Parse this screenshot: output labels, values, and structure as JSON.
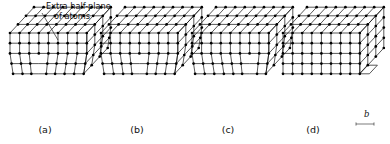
{
  "figure": {
    "background_color": "#ffffff",
    "line_color": "#111111",
    "back_line_color": "#555555",
    "atom_color": "#000000",
    "width": 390,
    "height": 144
  },
  "annotation": {
    "line1": "Extra half-plane",
    "line2": "of atoms",
    "text_x": 46,
    "text_y1": 9,
    "text_y2": 19,
    "leader": {
      "x1": 42,
      "y1": 13,
      "x2": 58,
      "y2": 40
    }
  },
  "panels": [
    {
      "id": "a",
      "label": "(a)",
      "label_x": 45,
      "label_y": 133,
      "origin_x": 10,
      "origin_y": 33,
      "dislocation_column": 3,
      "has_step": false,
      "state": "extra half-plane near left"
    },
    {
      "id": "b",
      "label": "(b)",
      "label_x": 137,
      "label_y": 133,
      "origin_x": 101,
      "origin_y": 33,
      "dislocation_column": 4,
      "has_step": false,
      "state": "dislocation advanced toward center"
    },
    {
      "id": "c",
      "label": "(c)",
      "label_x": 228,
      "label_y": 133,
      "origin_x": 192,
      "origin_y": 33,
      "dislocation_column": 6,
      "has_step": false,
      "state": "dislocation near right face"
    },
    {
      "id": "d",
      "label": "(d)",
      "label_x": 313,
      "label_y": 133,
      "origin_x": 283,
      "origin_y": 33,
      "dislocation_column": -1,
      "has_step": true,
      "state": "slip step formed, perfect lattice"
    }
  ],
  "burgers_vector": {
    "symbol": "b",
    "label_x": 364,
    "label_y": 117,
    "arrow_y": 124,
    "arrow_x1": 356,
    "arrow_x2": 374
  },
  "lattice": {
    "columns": 8,
    "rows": 5,
    "depth_rows": 3,
    "cell_width": 9.6,
    "cell_height": 10.2,
    "depth_dx": 8.0,
    "depth_dy": -8.6,
    "atom_radius": 1.35
  }
}
